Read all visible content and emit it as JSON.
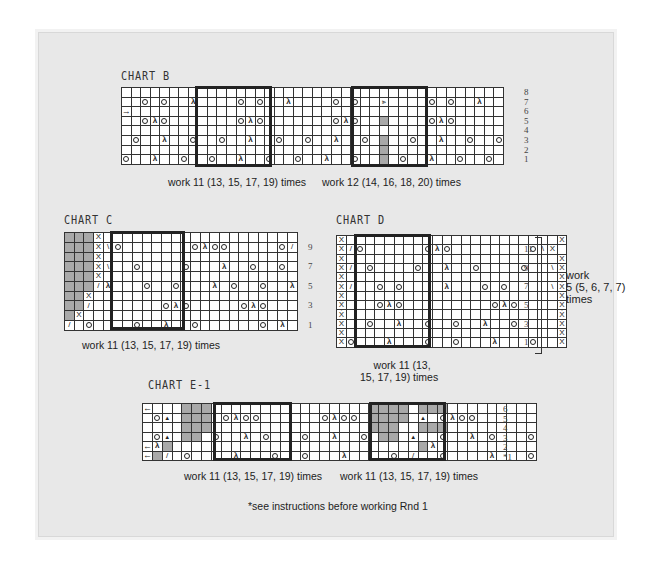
{
  "footnote": "*see instructions before working Rnd 1",
  "legend_codes": {
    ".": "knit (empty)",
    "o": "yarn over",
    "k": "decrease",
    "/": "right-slant decrease",
    "\\": "left-slant decrease",
    "t": "twisted stitch",
    "a": "centered double decrease",
    "c": "cable cross",
    "g": "no stitch (grey)",
    "r": "arrow left",
    "R": "arrow right"
  },
  "charts": {
    "b": {
      "title": "CHART B",
      "row_numbers": [
        "8",
        "7",
        "6",
        "5",
        "4",
        "3",
        "2",
        "1"
      ],
      "captions": [
        "work 11 (13, 15, 17, 19) times",
        "work 12 (14, 16, 18, 20) times"
      ],
      "rows": [
        "...............................................................................",
        "..o.o..k....o.o..k....o.o..c....o.o..k....o.o..c..",
        "R................................................g",
        "..oko.......oko.......oko..g....oko.......oko....g",
        "................................................g",
        ".o..k..o..o..k..o..o..k..o.g..o..k..o..o..k..o...g",
        "...........................g.....................g",
        "o..k..o..o..k..o..o..k..o..g.o..k..o..o..k..o....g"
      ]
    },
    "c": {
      "title": "CHART C",
      "row_numbers": [
        "",
        "9",
        "",
        "7",
        "",
        "5",
        "",
        "3",
        "",
        "1"
      ],
      "caption": "work 11 (13, 15, 17, 19) times",
      "rows": [
        "gggt....................tggg",
        "gggt\\o.......okoo.....o/tggg",
        "gggt....................tggg",
        "gggt\\..o....o...k..o..o./tggg",
        "gggt....................tggg",
        "ggg/k...o..o...k.o..o..k\\ggg",
        "ggt......................tgg",
        "gg/.......oko.....oko.....\\g",
        "gt........................tg",
        "/.o....o..k..o......o.k..o.\\"
      ]
    },
    "d": {
      "title": "CHART D",
      "row_numbers": [
        "",
        "11",
        "",
        "9",
        "",
        "7",
        "",
        "5",
        "",
        "3",
        "",
        "1"
      ],
      "caption_line1": "work 11 (13,",
      "caption_line2": "15, 17, 19) times",
      "side_label_line1": "work",
      "side_label_line2": "5 (5, 6, 7, 7)",
      "side_label_line3": "times",
      "rows": [
        "t......................t",
        "t/o......oko........o\\t",
        "t......................t",
        "t/.o....o..k..o....o..\\t",
        "t......................t",
        "t/..o.o....k...o.o....\\t",
        "t......................t",
        "t...oko.........oko....t",
        "t......................t",
        "t..o..k..o..o..k..o....t",
        "t......................t",
        "to...k...o..o...k...o..t"
      ]
    },
    "e1": {
      "title": "CHART E-1",
      "row_numbers": [
        "6",
        "5",
        "4",
        "3",
        "2",
        "*1"
      ],
      "captions": [
        "work 11 (13, 15, 17, 19) times",
        "work 11 (13, 15, 17, 19) times"
      ],
      "rows": [
        "r...ggg................gggg.ggg.................gggg",
        ".oa.ggg.okoo......okoo.gggg.a.okoo......ok.gggg",
        "....ggg................ggg..ggg.................gggg",
        ".oa.gg.o..k.o...o..k..o.gg.a..o..k.o...o..k...ggg",
        "rkg.........................gk........................g",
        "rg/.o....k...o..o...k....o./..o....k...o..o...k...o.."
      ]
    }
  }
}
